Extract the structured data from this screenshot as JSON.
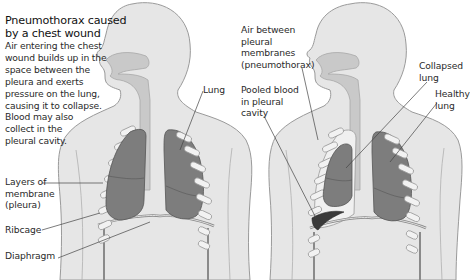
{
  "diagram": {
    "title": "Pneumothorax caused\nby a chest wound",
    "description": "Air entering the chest\nwound builds up in the\nspace between the\npleura and exerts\npressure on the lung,\ncausing it to collapse.\nBlood may also\ncollect in the\npleural cavity.",
    "left_figure": {
      "labels": {
        "lung": "Lung",
        "pleura": "Layers of\nmembrane\n(pleura)",
        "ribcage": "Ribcage",
        "diaphragm": "Diaphragm"
      }
    },
    "right_figure": {
      "labels": {
        "air": "Air between\npleural\nmembranes\n(pneumothorax)",
        "pooled_blood": "Pooled blood\nin pleural\ncavity",
        "collapsed_lung": "Collapsed\nlung",
        "healthy_lung": "Healthy\nlung"
      }
    },
    "colors": {
      "body": "#e6e6e6",
      "outline": "#9a9a9a",
      "airway": "#c9c9c9",
      "lung": "#7d7d7d",
      "lung_line": "#555555",
      "rib": "#f2f2f2",
      "blood": "#3a3a3a",
      "leader": "#444444"
    }
  }
}
